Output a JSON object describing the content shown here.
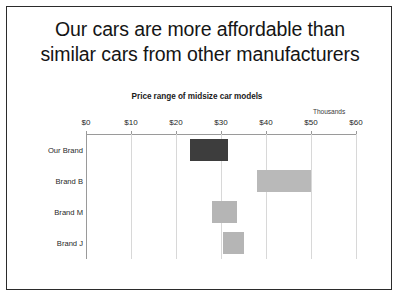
{
  "slide": {
    "title_line1": "Our cars are more affordable than",
    "title_line2": "similar cars from other manufacturers"
  },
  "chart_data": {
    "type": "bar",
    "orientation": "horizontal",
    "subtype": "floating-range-bar",
    "title": "Price range of midsize car models",
    "units_note": "Thousands",
    "xlabel": "",
    "ylabel": "",
    "xlim": [
      0,
      60
    ],
    "xticks": [
      0,
      10,
      20,
      30,
      40,
      50,
      60
    ],
    "xtick_labels": [
      "$0",
      "$10",
      "$20",
      "$30",
      "$40",
      "$50",
      "$60"
    ],
    "grid": true,
    "legend": "none",
    "categories": [
      "Our Brand",
      "Brand B",
      "Brand M",
      "Brand J"
    ],
    "ranges": [
      {
        "category": "Our Brand",
        "low": 23,
        "high": 31.5,
        "color": "#3d3d3d"
      },
      {
        "category": "Brand B",
        "low": 38,
        "high": 50,
        "color": "#b9b9b9"
      },
      {
        "category": "Brand M",
        "low": 28,
        "high": 33.5,
        "color": "#b5b5b5"
      },
      {
        "category": "Brand J",
        "low": 30.5,
        "high": 35,
        "color": "#b5b5b5"
      }
    ],
    "colors": {
      "highlight_bar": "#3d3d3d",
      "other_bar": "#b9b9b9",
      "gridline": "#d8d8d8",
      "axis": "#9a9a9a",
      "text": "#1f1f1f",
      "slide_border": "#2b2b2b",
      "background": "#ffffff"
    }
  }
}
